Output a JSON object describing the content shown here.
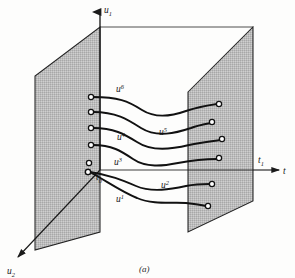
{
  "figure": {
    "caption": "(a)",
    "axes": [
      {
        "name": "u1",
        "base": "u",
        "sub": "1",
        "direction": "up"
      },
      {
        "name": "u2",
        "base": "u",
        "sub": "2",
        "direction": "down-left"
      },
      {
        "name": "t",
        "base": "t",
        "sub": "",
        "direction": "right"
      }
    ],
    "markers": [
      {
        "name": "t0",
        "base": "t",
        "sub": "0"
      },
      {
        "name": "t1",
        "base": "t",
        "sub": "1"
      }
    ],
    "planes": [
      {
        "name": "plane-t0",
        "label": "t0",
        "fill": "#b9b9b9"
      },
      {
        "name": "plane-t1",
        "label": "t1",
        "fill": "#b9b9b9"
      }
    ],
    "trajectories": [
      {
        "name": "u1",
        "base": "u",
        "sup": "1"
      },
      {
        "name": "u2",
        "base": "u",
        "sup": "2"
      },
      {
        "name": "u3",
        "base": "u",
        "sup": "3"
      },
      {
        "name": "u4",
        "base": "u",
        "sup": "4"
      },
      {
        "name": "u5",
        "base": "u",
        "sup": "5"
      },
      {
        "name": "u6",
        "base": "u",
        "sup": "6"
      }
    ],
    "colors": {
      "ink": "#1a1a1a",
      "plane_fill": "#b9b9b9",
      "plane_edge": "#222222",
      "background": "#fdfdfc",
      "marker_fill": "#ffffff"
    }
  }
}
